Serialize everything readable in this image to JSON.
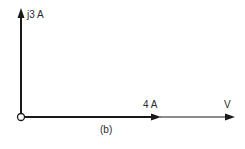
{
  "diagram": {
    "type": "phasor-diagram",
    "caption": "(b)",
    "phasors": [
      {
        "label": "j3 A",
        "direction": "up",
        "quantity": "current",
        "magnitude": 3,
        "angle_deg": 90
      },
      {
        "label": "4 A",
        "direction": "right",
        "quantity": "current",
        "magnitude": 4,
        "angle_deg": 0
      },
      {
        "label": "V",
        "direction": "right",
        "quantity": "voltage",
        "angle_deg": 0
      }
    ],
    "origin": "circle",
    "colors": {
      "line": "#1a1a1a",
      "text": "#2a2a2a",
      "background": "#ffffff"
    }
  }
}
